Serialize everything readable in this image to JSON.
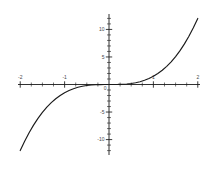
{
  "chart_data": {
    "type": "line",
    "title": "",
    "subtitle": "",
    "xlabel": "",
    "ylabel": "",
    "xlim": [
      -2.05,
      2.05
    ],
    "ylim": [
      -12.8,
      12.8
    ],
    "grid": false,
    "legend_position": "none",
    "background_color": "#ffffff",
    "axis_color": "#1a1a1a",
    "curve_color": "#1a1a1a",
    "x_major_ticks": [
      -2,
      -1,
      1,
      2
    ],
    "x_major_tick_labels": [
      "-2",
      "-1",
      "1",
      "2"
    ],
    "x_minor_tick_step": 0.25,
    "y_major_ticks": [
      -10,
      -5,
      5,
      10
    ],
    "y_major_tick_labels": [
      "-10",
      "-5",
      "5",
      "10"
    ],
    "y_minor_tick_step": 1,
    "origin_label": "0",
    "series": [
      {
        "name": "cubic",
        "x": [
          -2.0,
          -1.9,
          -1.8,
          -1.7,
          -1.6,
          -1.5,
          -1.4,
          -1.3,
          -1.2,
          -1.1,
          -1.0,
          -0.9,
          -0.8,
          -0.7,
          -0.6,
          -0.5,
          -0.4,
          -0.3,
          -0.2,
          -0.1,
          0.0,
          0.1,
          0.2,
          0.3,
          0.4,
          0.5,
          0.6,
          0.7,
          0.8,
          0.9,
          1.0,
          1.1,
          1.2,
          1.3,
          1.4,
          1.5,
          1.6,
          1.7,
          1.8,
          1.9,
          2.0
        ],
        "values": [
          -12.0,
          -10.29,
          -8.75,
          -7.37,
          -6.14,
          -5.06,
          -4.12,
          -3.3,
          -2.59,
          -2.0,
          -1.5,
          -1.09,
          -0.77,
          -0.51,
          -0.32,
          -0.19,
          -0.1,
          -0.04,
          -0.01,
          0.0,
          0.0,
          0.0,
          0.01,
          0.04,
          0.1,
          0.19,
          0.32,
          0.51,
          0.77,
          1.09,
          1.5,
          2.0,
          2.59,
          3.3,
          4.12,
          5.06,
          6.14,
          7.37,
          8.75,
          10.29,
          12.0
        ]
      }
    ]
  }
}
